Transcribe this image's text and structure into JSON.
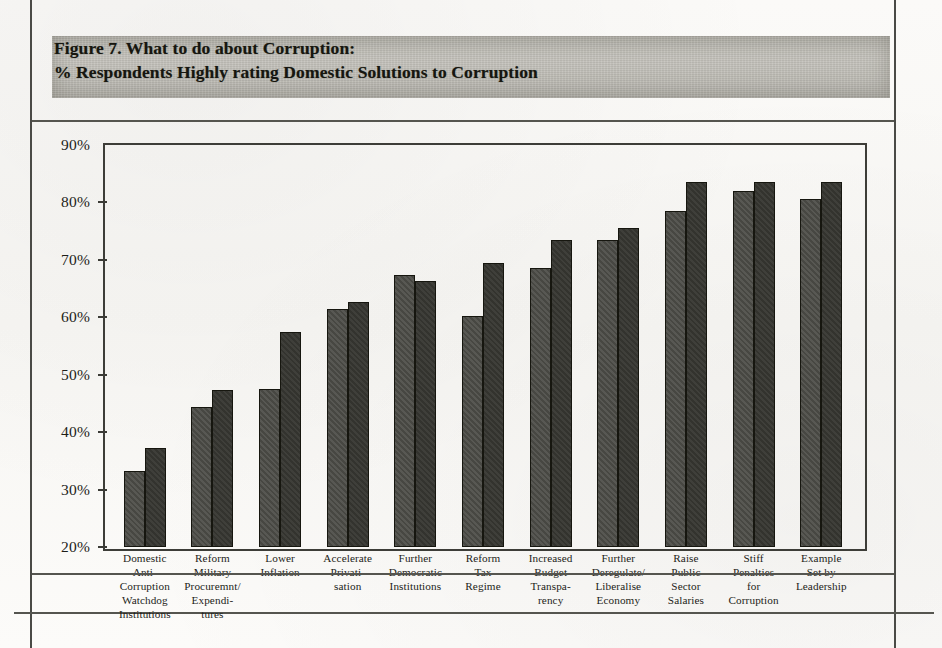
{
  "figure": {
    "title_line1": "Figure 7.  What to do about Corruption:",
    "title_line2": "% Respondents Highly rating Domestic Solutions to Corruption"
  },
  "chart_data": {
    "type": "bar",
    "title": "Figure 7. What to do about Corruption: % Respondents Highly rating Domestic Solutions to Corruption",
    "xlabel": "",
    "ylabel": "",
    "ylim": [
      20,
      90
    ],
    "ytick_labels": [
      "90%",
      "80%",
      "70%",
      "60%",
      "50%",
      "40%",
      "30%",
      "20%"
    ],
    "ytick_values": [
      90,
      80,
      70,
      60,
      50,
      40,
      30,
      20
    ],
    "grid": false,
    "legend": "none",
    "categories": [
      "Domestic Anti-Corruption Watchdog Institutions",
      "Reform Military Procuremnt/ Expenditures",
      "Lower Inflation",
      "Accelerate Privatisation",
      "Further Democratic Institutions",
      "Reform Tax Regime",
      "Increased Budget Transparency",
      "Further Deregulate/ Liberalise Economy",
      "Raise Public Sector Salaries",
      "Stiff Penalties for Corruption",
      "Example Set by Leadership"
    ],
    "category_label_lines": [
      [
        "Domestic",
        "Anti-",
        "Corruption",
        "Watchdog",
        "Institutions"
      ],
      [
        "Reform",
        "Military",
        "Procuremnt/",
        "Expendi-",
        "tures"
      ],
      [
        "Lower",
        "Inflation"
      ],
      [
        "Accelerate",
        "Privati-",
        "sation"
      ],
      [
        "Further",
        "Democratic",
        "Institutions"
      ],
      [
        "Reform",
        "Tax",
        "Regime"
      ],
      [
        "Increased",
        "Budget",
        "Transpa-",
        "rency"
      ],
      [
        "Further",
        "Deregulate/",
        "Liberalise",
        "Economy"
      ],
      [
        "Raise",
        "Public",
        "Sector",
        "Salaries"
      ],
      [
        "Stiff",
        "Penalties",
        "for",
        "Corruption"
      ],
      [
        "Example",
        "Set by",
        "Leadership"
      ]
    ],
    "series": [
      {
        "name": "Series 1",
        "color": "#4b4b46",
        "values": [
          33.3,
          44.3,
          47.5,
          61.4,
          67.4,
          60.3,
          68.5,
          73.4,
          78.5,
          82.0,
          80.6
        ]
      },
      {
        "name": "Series 2",
        "color": "#373732",
        "values": [
          37.2,
          47.3,
          57.4,
          62.6,
          66.3,
          69.5,
          73.5,
          75.5,
          83.6,
          83.6,
          83.6
        ]
      }
    ]
  }
}
